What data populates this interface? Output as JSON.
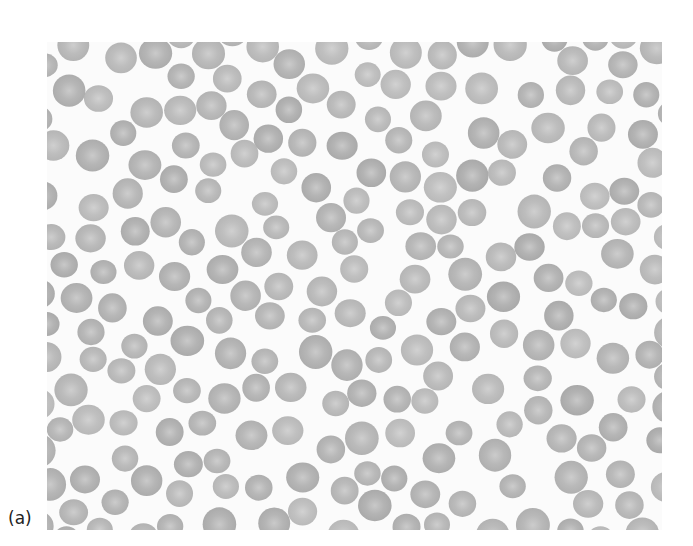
{
  "figure": {
    "label": "(a)",
    "cell_color": "#a9a9a9",
    "cell_center_color": "#c8c8c8",
    "background_color": "#fbfbfb"
  }
}
